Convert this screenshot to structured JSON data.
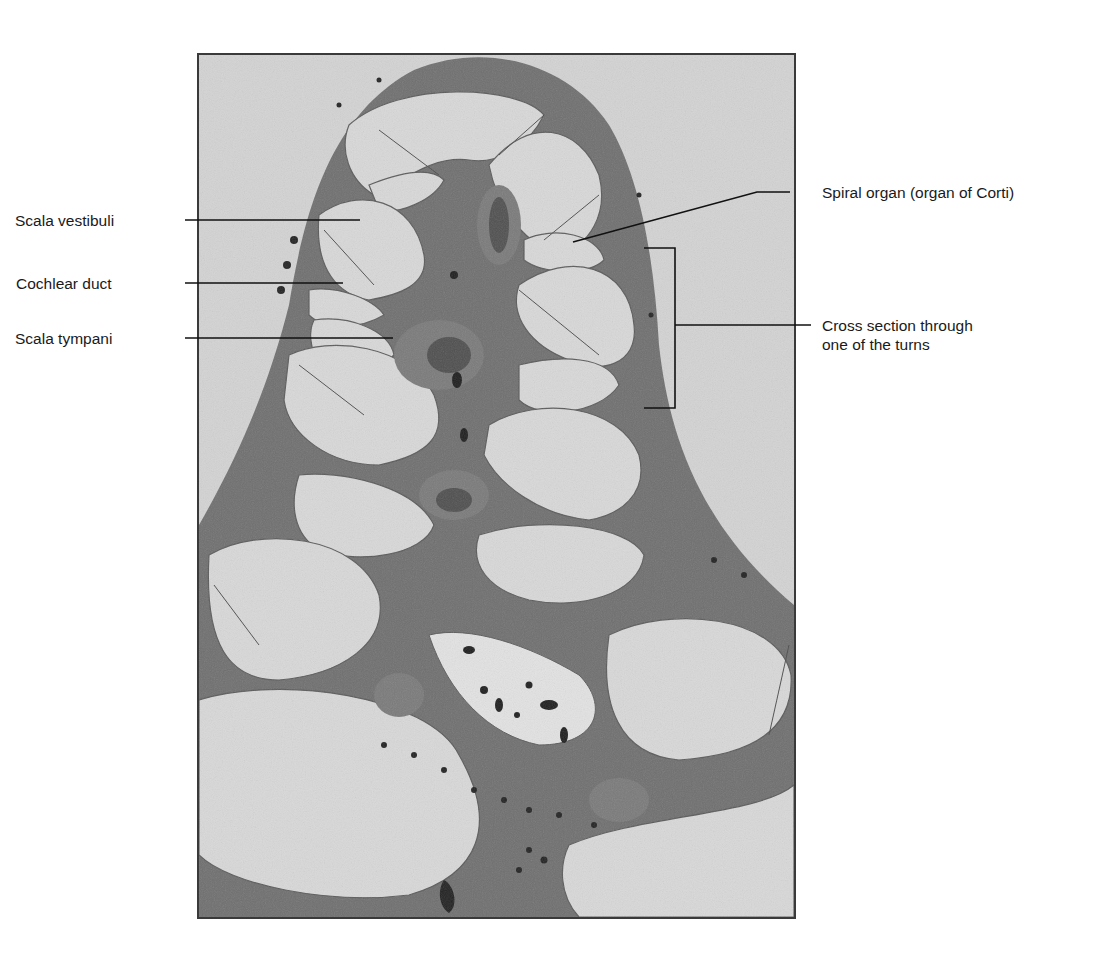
{
  "figure": {
    "colors": {
      "background": "#ffffff",
      "frame_border": "#3a3a3a",
      "bone_tissue": "#6e6e6e",
      "fluid_space": "#d6d6d6",
      "dark_nuclei": "#1e1e1e",
      "leader_line": "#111111",
      "label_text": "#1a1a1a"
    }
  },
  "labels": {
    "left": [
      {
        "id": "scala-vestibuli",
        "text": "Scala vestibuli"
      },
      {
        "id": "cochlear-duct",
        "text": "Cochlear duct"
      },
      {
        "id": "scala-tympani",
        "text": "Scala tympani"
      }
    ],
    "right": [
      {
        "id": "spiral-organ",
        "text": "Spiral organ (organ of Corti)"
      },
      {
        "id": "cross-section",
        "lines": [
          "Cross section through",
          "one of the turns"
        ]
      }
    ]
  }
}
